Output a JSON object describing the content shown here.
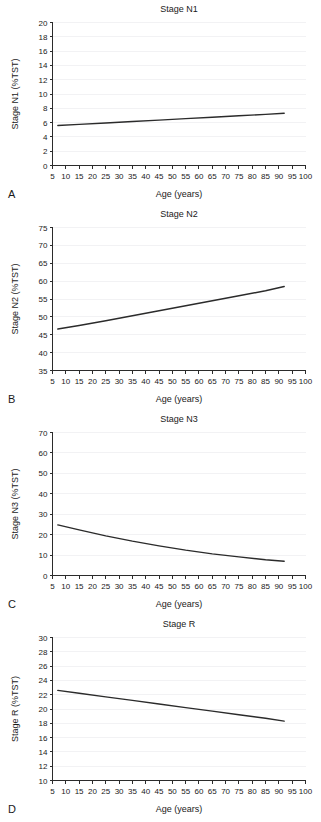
{
  "figure": {
    "letters": [
      "A",
      "B",
      "C",
      "D"
    ]
  },
  "chart_data": [
    {
      "type": "line",
      "panel_letter": "A",
      "title": "Stage N1",
      "xlabel": "Age (years)",
      "ylabel": "Stage N1 (%TST)",
      "xlim": [
        5,
        100
      ],
      "ylim": [
        0,
        20
      ],
      "xticks": [
        5,
        10,
        15,
        20,
        25,
        30,
        35,
        40,
        45,
        50,
        55,
        60,
        65,
        70,
        75,
        80,
        85,
        90,
        95,
        100
      ],
      "yticks": [
        0,
        2,
        4,
        6,
        8,
        10,
        12,
        14,
        16,
        18,
        20
      ],
      "grid": true,
      "legend": "none",
      "series": [
        {
          "name": "Stage N1 %TST",
          "x": [
            7,
            15,
            25,
            35,
            45,
            55,
            65,
            75,
            85,
            92
          ],
          "values": [
            5.6,
            5.75,
            5.95,
            6.15,
            6.35,
            6.55,
            6.75,
            6.95,
            7.15,
            7.3
          ]
        }
      ]
    },
    {
      "type": "line",
      "panel_letter": "B",
      "title": "Stage N2",
      "xlabel": "Age (years)",
      "ylabel": "Stage N2 (%TST)",
      "xlim": [
        5,
        100
      ],
      "ylim": [
        35,
        75
      ],
      "xticks": [
        5,
        10,
        15,
        20,
        25,
        30,
        35,
        40,
        45,
        50,
        55,
        60,
        65,
        70,
        75,
        80,
        85,
        90,
        95,
        100
      ],
      "yticks": [
        35,
        40,
        45,
        50,
        55,
        60,
        65,
        70,
        75
      ],
      "grid": true,
      "legend": "none",
      "series": [
        {
          "name": "Stage N2 %TST",
          "x": [
            7,
            15,
            25,
            35,
            45,
            55,
            65,
            75,
            85,
            92
          ],
          "values": [
            46.6,
            47.6,
            48.9,
            50.3,
            51.7,
            53.1,
            54.5,
            55.9,
            57.3,
            58.5
          ]
        }
      ]
    },
    {
      "type": "line",
      "panel_letter": "C",
      "title": "Stage N3",
      "xlabel": "Age (years)",
      "ylabel": "Stage N3 (%TST)",
      "xlim": [
        5,
        100
      ],
      "ylim": [
        0,
        70
      ],
      "xticks": [
        5,
        10,
        15,
        20,
        25,
        30,
        35,
        40,
        45,
        50,
        55,
        60,
        65,
        70,
        75,
        80,
        85,
        90,
        95,
        100
      ],
      "yticks": [
        0,
        10,
        20,
        30,
        40,
        50,
        60,
        70
      ],
      "grid": true,
      "legend": "none",
      "series": [
        {
          "name": "Stage N3 %TST",
          "x": [
            7,
            15,
            25,
            35,
            45,
            55,
            65,
            75,
            85,
            92
          ],
          "values": [
            24.8,
            22.3,
            19.4,
            16.8,
            14.5,
            12.4,
            10.6,
            9.1,
            7.7,
            7.0
          ]
        }
      ]
    },
    {
      "type": "line",
      "panel_letter": "D",
      "title": "Stage R",
      "xlabel": "Age (years)",
      "ylabel": "Stage R (%TST)",
      "xlim": [
        5,
        100
      ],
      "ylim": [
        10,
        30
      ],
      "xticks": [
        5,
        10,
        15,
        20,
        25,
        30,
        35,
        40,
        45,
        50,
        55,
        60,
        65,
        70,
        75,
        80,
        85,
        90,
        95,
        100
      ],
      "yticks": [
        10,
        12,
        14,
        16,
        18,
        20,
        22,
        24,
        26,
        28,
        30
      ],
      "grid": true,
      "legend": "none",
      "series": [
        {
          "name": "Stage R %TST",
          "x": [
            7,
            15,
            25,
            35,
            45,
            55,
            65,
            75,
            85,
            92
          ],
          "values": [
            22.6,
            22.2,
            21.7,
            21.2,
            20.7,
            20.2,
            19.7,
            19.2,
            18.7,
            18.3
          ]
        }
      ]
    }
  ]
}
